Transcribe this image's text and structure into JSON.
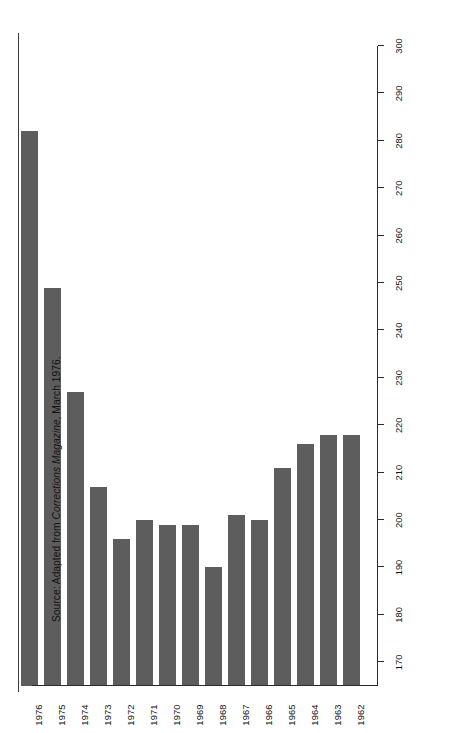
{
  "source_note": {
    "prefix": "Source: Adapted from ",
    "italic_part": "Corrections Magazine",
    "suffix": ", March 1976."
  },
  "chart_data": {
    "type": "bar",
    "orientation": "vertical-on-page-rotated-90",
    "title": "",
    "subtitle": "",
    "xlabel": "",
    "ylabel": "",
    "grid": false,
    "legend": null,
    "categories": [
      "1962",
      "1963",
      "1964",
      "1965",
      "1966",
      "1967",
      "1968",
      "1969",
      "1970",
      "1971",
      "1972",
      "1973",
      "1974",
      "1975",
      "1976"
    ],
    "values": [
      218,
      218,
      216,
      211,
      200,
      201,
      190,
      199,
      199,
      200,
      196,
      207,
      227,
      249,
      282
    ],
    "ylim": [
      165,
      300
    ],
    "tick_values": [
      300,
      290,
      280,
      270,
      260,
      250,
      240,
      230,
      220,
      210,
      200,
      190,
      180,
      170
    ],
    "tick_labels": [
      "300",
      "290",
      "280",
      "270",
      "260",
      "250",
      "240",
      "230",
      "220",
      "210",
      "200",
      "190",
      "180",
      "170"
    ],
    "bar_color": "#5d5d5d",
    "axis_color": "#2b2b2b",
    "background": "#ffffff"
  }
}
